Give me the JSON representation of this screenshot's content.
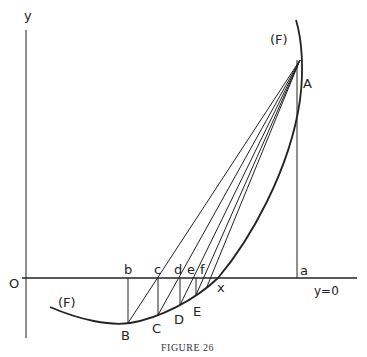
{
  "figure": {
    "caption": "Figure 26",
    "caption_display": "FIGURE 26"
  },
  "axes": {
    "y_label": "y",
    "origin_label": "O",
    "line_label": "y=0"
  },
  "curve": {
    "label_top": "(F)",
    "label_bottom": "(F)"
  },
  "points": {
    "A": "A",
    "B": "B",
    "C": "C",
    "D": "D",
    "E": "E"
  },
  "axis_points": {
    "a": "a",
    "b": "b",
    "c": "c",
    "d": "d",
    "e": "e",
    "f": "f",
    "x": "x"
  }
}
